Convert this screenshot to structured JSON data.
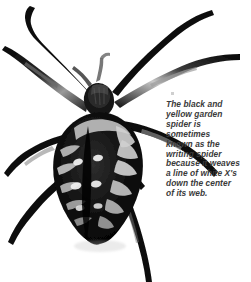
{
  "image": {
    "subject": "black-and-yellow-garden-spider",
    "view": "dorsal view of spider, legs outstretched",
    "rendering": "high-contrast black and white photograph",
    "background_color": "#ffffff",
    "width": 251,
    "height": 282
  },
  "caption": {
    "text": "The black and\nyellow garden\nspider is\nsometimes\nknown as the\nwriting spider\nbecause it weaves\na line of white X's\ndown the center\nof its web.",
    "lines": [
      "The black and",
      "yellow garden",
      "spider is",
      "sometimes",
      "known as the",
      "writing spider",
      "because it weaves",
      "a line of white X's",
      "down the center",
      "of its web."
    ],
    "color": "#3a3a3a",
    "style": "bold-italic"
  },
  "colors": {
    "background": "#ffffff",
    "spider_dark": "#050505",
    "spider_mid": "#6f6f6f",
    "spider_light": "#d8d8d8",
    "spider_highlight": "#f2f2f2",
    "caption_text": "#3a3a3a",
    "caption_mark": "#cfcfcf"
  }
}
